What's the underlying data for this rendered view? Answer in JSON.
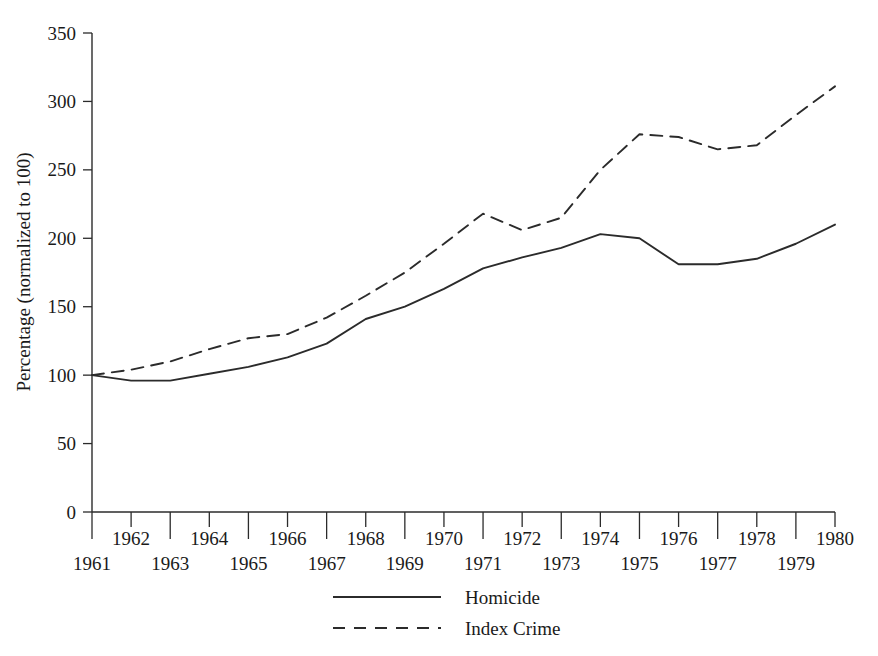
{
  "chart_data": {
    "type": "line",
    "title": "",
    "xlabel": "",
    "ylabel": "Percentage (normalized to 100)",
    "x": [
      1961,
      1962,
      1963,
      1964,
      1965,
      1966,
      1967,
      1968,
      1969,
      1970,
      1971,
      1972,
      1973,
      1974,
      1975,
      1976,
      1977,
      1978,
      1979,
      1980
    ],
    "xtick_labels": [
      "1961",
      "1962",
      "1963",
      "1964",
      "1965",
      "1966",
      "1967",
      "1968",
      "1969",
      "1970",
      "1971",
      "1972",
      "1973",
      "1974",
      "1975",
      "1976",
      "1977",
      "1978",
      "1979",
      "1980"
    ],
    "ytick_labels": [
      "0",
      "50",
      "100",
      "150",
      "200",
      "250",
      "300",
      "350"
    ],
    "ytick_values": [
      0,
      50,
      100,
      150,
      200,
      250,
      300,
      350
    ],
    "xlim": [
      1961,
      1980
    ],
    "ylim": [
      0,
      350
    ],
    "grid": false,
    "legend_position": "below-axes-center",
    "series": [
      {
        "name": "Homicide",
        "style": "solid",
        "values": [
          100,
          96,
          96,
          101,
          106,
          113,
          122,
          131,
          141,
          148,
          158,
          168,
          178,
          188,
          197,
          203,
          200,
          181,
          181,
          186
        ]
      },
      {
        "name": "Index Crime",
        "style": "dashed",
        "values": [
          100,
          103,
          110,
          119,
          126,
          129,
          139,
          152,
          165,
          180,
          193,
          204,
          212,
          218,
          206,
          212,
          215,
          235,
          258,
          276
        ]
      }
    ],
    "series_plotted": {
      "Homicide": [
        [
          1961,
          100
        ],
        [
          1962,
          96
        ],
        [
          1963,
          96
        ],
        [
          1964,
          101
        ],
        [
          1965,
          106
        ],
        [
          1966,
          113
        ],
        [
          1967,
          123
        ],
        [
          1968,
          141
        ],
        [
          1969,
          150
        ],
        [
          1970,
          163
        ],
        [
          1971,
          178
        ],
        [
          1972,
          186
        ],
        [
          1973,
          193
        ],
        [
          1974,
          203
        ],
        [
          1975,
          200
        ],
        [
          1976,
          181
        ],
        [
          1977,
          181
        ],
        [
          1978,
          185
        ],
        [
          1979,
          196
        ],
        [
          1980,
          210
        ]
      ],
      "Index Crime": [
        [
          1961,
          100
        ],
        [
          1962,
          104
        ],
        [
          1963,
          110
        ],
        [
          1964,
          119
        ],
        [
          1965,
          127
        ],
        [
          1966,
          130
        ],
        [
          1967,
          142
        ],
        [
          1968,
          158
        ],
        [
          1969,
          175
        ],
        [
          1970,
          196
        ],
        [
          1971,
          218
        ],
        [
          1972,
          206
        ],
        [
          1973,
          215
        ],
        [
          1974,
          250
        ],
        [
          1975,
          276
        ],
        [
          1976,
          274
        ],
        [
          1977,
          265
        ],
        [
          1978,
          268
        ],
        [
          1979,
          290
        ],
        [
          1980,
          311
        ]
      ]
    }
  },
  "legend": {
    "entries": [
      {
        "label": "Homicide",
        "style": "solid"
      },
      {
        "label": "Index Crime",
        "style": "dashed"
      }
    ]
  },
  "axes": {
    "y_axis_title": "Percentage (normalized to 100)"
  },
  "colors": {
    "line": "#2b2b2b",
    "axis": "#2b2b2b",
    "text": "#1a1a1a",
    "background": "#ffffff"
  },
  "caption": {
    "ghost_text": ""
  }
}
